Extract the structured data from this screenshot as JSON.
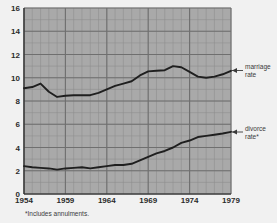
{
  "chart_data": {
    "type": "line",
    "title": "",
    "xlabel": "",
    "ylabel": "",
    "xlim": [
      1954,
      1979
    ],
    "ylim": [
      0,
      16
    ],
    "grid": true,
    "grid_major_x_step": 5,
    "grid_minor_x_step": 1,
    "grid_major_y_step": 2,
    "grid_minor_y_step": 1,
    "legend_position": "right-inline-annotations",
    "xticks": [
      "1954",
      "1959",
      "1964",
      "1969",
      "1974",
      "1979"
    ],
    "xtick_values": [
      1954,
      1959,
      1964,
      1969,
      1974,
      1979
    ],
    "yticks": [
      "0",
      "2",
      "4",
      "6",
      "8",
      "10",
      "12",
      "14",
      "16"
    ],
    "ytick_values": [
      0,
      2,
      4,
      6,
      8,
      10,
      12,
      14,
      16
    ],
    "x": [
      1954,
      1955,
      1956,
      1957,
      1958,
      1959,
      1960,
      1961,
      1962,
      1963,
      1964,
      1965,
      1966,
      1967,
      1968,
      1969,
      1970,
      1971,
      1972,
      1973,
      1974,
      1975,
      1976,
      1977,
      1978,
      1979
    ],
    "series": [
      {
        "name": "marriage rate",
        "label": "marriage rate",
        "color": "#1f1f1f",
        "values": [
          9.1,
          9.2,
          9.5,
          8.8,
          8.35,
          8.45,
          8.5,
          8.5,
          8.5,
          8.7,
          9.0,
          9.3,
          9.5,
          9.7,
          10.2,
          10.55,
          10.6,
          10.65,
          11.0,
          10.9,
          10.5,
          10.1,
          10.0,
          10.1,
          10.3,
          10.6
        ]
      },
      {
        "name": "divorce rate",
        "label": "divorce rate*",
        "color": "#1f1f1f",
        "values": [
          2.4,
          2.3,
          2.25,
          2.2,
          2.1,
          2.2,
          2.25,
          2.3,
          2.2,
          2.3,
          2.4,
          2.5,
          2.5,
          2.6,
          2.9,
          3.2,
          3.5,
          3.7,
          4.0,
          4.4,
          4.6,
          4.9,
          5.0,
          5.1,
          5.2,
          5.35
        ]
      }
    ],
    "footnote": "*Includes annulments.",
    "plot_bg_color": "#a9a9a9",
    "page_bg_color": "#f1f1f1",
    "grid_minor_color": "#8e8e8e",
    "grid_major_color": "#6f6f6f"
  },
  "annotations": {
    "marriage": {
      "line1": "marriage",
      "line2": "rate"
    },
    "divorce": {
      "line1": "divorce",
      "line2": "rate*"
    }
  },
  "footnote": {
    "text": "*Includes annulments."
  }
}
